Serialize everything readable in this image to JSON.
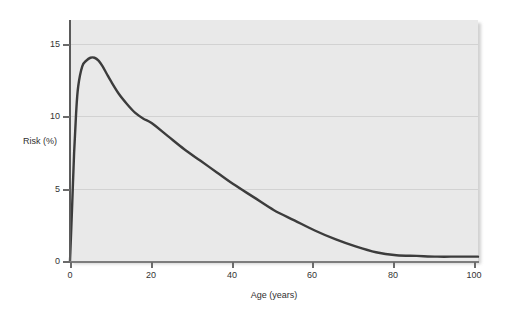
{
  "chart_data": {
    "type": "line",
    "title": "",
    "xlabel": "Age (years)",
    "ylabel": "Risk (%)",
    "xlim": [
      0,
      100
    ],
    "ylim": [
      0,
      16.6
    ],
    "xticks": [
      0,
      20,
      40,
      60,
      80,
      100
    ],
    "xtick_labels": [
      "0",
      "20",
      "40",
      "60",
      "80",
      "100"
    ],
    "yticks": [
      0,
      5,
      10,
      15
    ],
    "ytick_labels": [
      "0",
      "5",
      "10",
      "15"
    ],
    "grid": "horizontal",
    "gridlines_at": [
      5,
      10,
      15
    ],
    "legend": "none",
    "series": [
      {
        "name": "Risk",
        "color": "#3c3c3c",
        "x": [
          0,
          0.5,
          1,
          1.5,
          2,
          3,
          4,
          5,
          6,
          7,
          8,
          9,
          10,
          12,
          14,
          16,
          18,
          20,
          24,
          28,
          32,
          36,
          40,
          45,
          50,
          55,
          60,
          65,
          70,
          75,
          80,
          85,
          90,
          95,
          100
        ],
        "values": [
          0,
          3.6,
          7.4,
          10.2,
          12.0,
          13.4,
          13.8,
          14.0,
          14.0,
          13.8,
          13.4,
          12.9,
          12.4,
          11.5,
          10.8,
          10.2,
          9.8,
          9.5,
          8.6,
          7.7,
          6.9,
          6.1,
          5.3,
          4.4,
          3.5,
          2.8,
          2.1,
          1.5,
          1.0,
          0.6,
          0.4,
          0.35,
          0.3,
          0.3,
          0.3
        ]
      }
    ],
    "peak": {
      "x": 6,
      "y": 14.0
    },
    "annotations": []
  },
  "axis_titles": {
    "y": "Risk (%)",
    "x": "Age (years)"
  },
  "colors": {
    "panel_background": "#e9e9e9",
    "gridline": "#d2d2d2",
    "curve": "#3c3c3c",
    "axis": "#5a5a5a",
    "text": "#333333",
    "page_background": "#ffffff"
  }
}
